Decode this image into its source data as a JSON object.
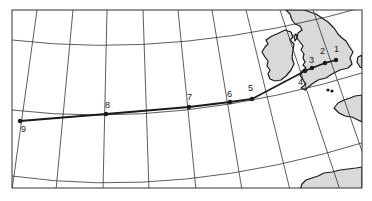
{
  "map": {
    "type": "route-map",
    "projection": "conic-graticule",
    "colors": {
      "land": "#d9d9d9",
      "coastline": "#1a1a1a",
      "graticule": "#333333",
      "route": "#1a1a1a",
      "background": "#ffffff"
    },
    "frame": {
      "x": 12,
      "y": 10,
      "width": 350,
      "height": 178
    },
    "route": {
      "points": [
        {
          "id": "1",
          "label": "1",
          "x": 336,
          "y": 60,
          "lx": 334,
          "ly": 52
        },
        {
          "id": "2",
          "label": "2",
          "x": 325,
          "y": 63,
          "lx": 320,
          "ly": 54
        },
        {
          "id": "3",
          "label": "3",
          "x": 312,
          "y": 68,
          "lx": 309,
          "ly": 63
        },
        {
          "id": "4",
          "label": "4",
          "x": 305,
          "y": 71,
          "lx": 298,
          "ly": 85
        },
        {
          "id": "5",
          "label": "5",
          "x": 252,
          "y": 99,
          "lx": 248,
          "ly": 91
        },
        {
          "id": "6",
          "label": "6",
          "x": 230,
          "y": 102,
          "lx": 227,
          "ly": 97
        },
        {
          "id": "7",
          "label": "7",
          "x": 189,
          "y": 107,
          "lx": 187,
          "ly": 100
        },
        {
          "id": "8",
          "label": "8",
          "x": 106,
          "y": 114,
          "lx": 105,
          "ly": 108
        },
        {
          "id": "9",
          "label": "9",
          "x": 20,
          "y": 121,
          "lx": 21,
          "ly": 132
        }
      ]
    }
  }
}
